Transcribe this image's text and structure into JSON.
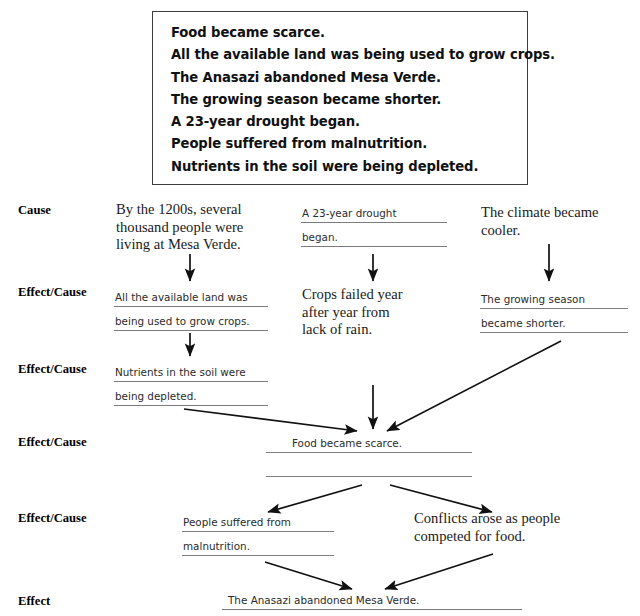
{
  "word_bank": {
    "items": [
      "Food became scarce.",
      "All the available land was being used to grow crops.",
      "The Anasazi abandoned Mesa Verde.",
      "The growing season became shorter.",
      "A 23-year drought began.",
      "People suffered from malnutrition.",
      "Nutrients in the soil were being depleted."
    ]
  },
  "row_labels": [
    {
      "text": "Cause"
    },
    {
      "text": "Effect/Cause"
    },
    {
      "text": "Effect/Cause"
    },
    {
      "text": "Effect/Cause"
    },
    {
      "text": "Effect/Cause"
    },
    {
      "text": "Effect"
    }
  ],
  "chain": {
    "r1_left_printed": {
      "line1": "By the 1200s, several",
      "line2": "thousand people were",
      "line3": "living at Mesa Verde."
    },
    "r1_mid_answer": {
      "line1": "A 23-year drought",
      "line2": "began."
    },
    "r1_right_printed": {
      "line1": "The climate became",
      "line2": "cooler."
    },
    "r2_left_answer": {
      "line1": "All the available land was",
      "line2": "being used to grow crops."
    },
    "r2_mid_printed": {
      "line1": "Crops failed year",
      "line2": "after year from",
      "line3": "lack of rain."
    },
    "r2_right_answer": {
      "line1": "The growing season",
      "line2": "became shorter."
    },
    "r3_left_answer": {
      "line1": "Nutrients in the soil were",
      "line2": "being depleted."
    },
    "r4_center_answer": {
      "line1": "Food became scarce.",
      "line2": ""
    },
    "r5_left_answer": {
      "line1": "People suffered from",
      "line2": "malnutrition."
    },
    "r5_right_printed": {
      "line1": "Conflicts arose as people",
      "line2": "competed for food."
    },
    "r6_center_answer": {
      "line1": "The Anasazi abandoned Mesa Verde.",
      "line2": ""
    }
  },
  "colors": {
    "ink": "#1a1a1a",
    "rule_line": "#7c7c7c",
    "box_border": "#3d3d3d",
    "arrow": "#111111",
    "page_background": "#ffffff"
  }
}
